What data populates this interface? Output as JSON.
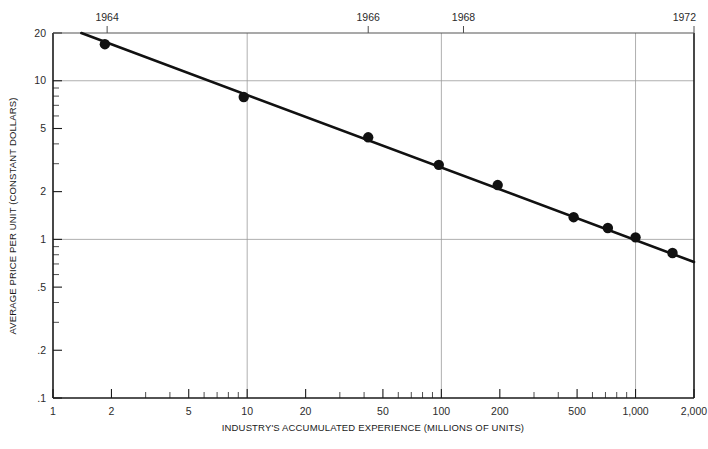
{
  "chart_data": {
    "type": "scatter",
    "title": "",
    "xlabel": "INDUSTRY'S ACCUMULATED EXPERIENCE (MILLIONS OF UNITS)",
    "ylabel": "AVERAGE PRICE PER UNIT (CONSTANT DOLLARS)",
    "xscale": "log",
    "yscale": "log",
    "xlim": [
      1,
      2000
    ],
    "ylim": [
      0.1,
      20
    ],
    "grid": true,
    "grid_x_values": [
      10,
      100,
      1000
    ],
    "grid_y_values": [
      10,
      1
    ],
    "legend": "none",
    "x_tick_labels": [
      "1",
      "2",
      "5",
      "10",
      "20",
      "50",
      "100",
      "200",
      "500",
      "1,000",
      "2,000"
    ],
    "x_tick_values": [
      1,
      2,
      5,
      10,
      20,
      50,
      100,
      200,
      500,
      1000,
      2000
    ],
    "y_tick_labels": [
      "20",
      "10",
      "5",
      "2",
      "1",
      ".5",
      ".2",
      ".1"
    ],
    "y_tick_values": [
      20,
      10,
      5,
      2,
      1,
      0.5,
      0.2,
      0.1
    ],
    "secondary_axis": {
      "position": "top",
      "name": "year-axis",
      "tick_labels": [
        "1964",
        "1966",
        "1968",
        "1972"
      ],
      "tick_x_values": [
        1.9,
        42,
        130,
        2000
      ]
    },
    "series": [
      {
        "name": "Average price per unit",
        "marker": "filled-circle",
        "color": "#111111",
        "points": [
          {
            "x": 1.85,
            "y": 17.0
          },
          {
            "x": 9.6,
            "y": 7.9
          },
          {
            "x": 42,
            "y": 4.4
          },
          {
            "x": 97,
            "y": 2.95
          },
          {
            "x": 195,
            "y": 2.2
          },
          {
            "x": 480,
            "y": 1.38
          },
          {
            "x": 720,
            "y": 1.18
          },
          {
            "x": 1000,
            "y": 1.03
          },
          {
            "x": 1550,
            "y": 0.82
          }
        ]
      }
    ],
    "trend_line": {
      "name": "experience-curve-fit",
      "color": "#111111",
      "from": {
        "x": 1.4,
        "y": 20.0
      },
      "to": {
        "x": 2000,
        "y": 0.72
      }
    }
  },
  "axes": {
    "x_title": "INDUSTRY'S ACCUMULATED EXPERIENCE (MILLIONS OF UNITS)",
    "y_title": "AVERAGE PRICE PER UNIT (CONSTANT DOLLARS)"
  }
}
